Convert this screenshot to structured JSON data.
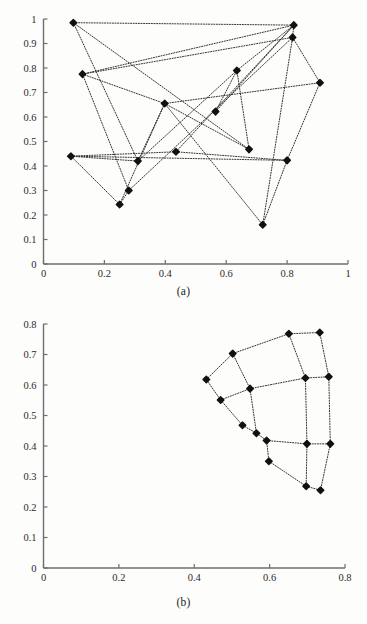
{
  "figure": {
    "subcaption_a": "(a)",
    "subcaption_b": "(b)",
    "bottom_artifact": ""
  },
  "chart_data": [
    {
      "id": "a",
      "type": "scatter",
      "title": "",
      "subcaption": "(a)",
      "xlabel": "",
      "ylabel": "",
      "xlim": [
        0,
        1
      ],
      "ylim": [
        0,
        1
      ],
      "grid": false,
      "legend": null,
      "xticks": [
        0,
        0.2,
        0.4,
        0.6,
        0.8,
        1
      ],
      "xticklabels": [
        "0",
        "0.2",
        "0.4",
        "0.6",
        "0.8",
        "1"
      ],
      "yticks": [
        0,
        0.1,
        0.2,
        0.3,
        0.4,
        0.5,
        0.6,
        0.7,
        0.8,
        0.9,
        1
      ],
      "yticklabels": [
        "0",
        "0.1",
        "0.2",
        "0.3",
        "0.4",
        "0.5",
        "0.6",
        "0.7",
        "0.8",
        "0.9",
        "1"
      ],
      "marker": "filled-diamond",
      "line_style": "dotted",
      "points": [
        {
          "i": 0,
          "x": 0.098,
          "y": 0.985
        },
        {
          "i": 1,
          "x": 0.128,
          "y": 0.775
        },
        {
          "i": 2,
          "x": 0.09,
          "y": 0.44
        },
        {
          "i": 3,
          "x": 0.25,
          "y": 0.243
        },
        {
          "i": 4,
          "x": 0.28,
          "y": 0.3
        },
        {
          "i": 5,
          "x": 0.31,
          "y": 0.42
        },
        {
          "i": 6,
          "x": 0.398,
          "y": 0.655
        },
        {
          "i": 7,
          "x": 0.435,
          "y": 0.458
        },
        {
          "i": 8,
          "x": 0.565,
          "y": 0.622
        },
        {
          "i": 9,
          "x": 0.635,
          "y": 0.79
        },
        {
          "i": 10,
          "x": 0.675,
          "y": 0.468
        },
        {
          "i": 11,
          "x": 0.72,
          "y": 0.16
        },
        {
          "i": 12,
          "x": 0.8,
          "y": 0.423
        },
        {
          "i": 13,
          "x": 0.818,
          "y": 0.925
        },
        {
          "i": 14,
          "x": 0.822,
          "y": 0.975
        },
        {
          "i": 15,
          "x": 0.908,
          "y": 0.74
        }
      ],
      "edges": [
        [
          0,
          14
        ],
        [
          0,
          5
        ],
        [
          0,
          10
        ],
        [
          1,
          14
        ],
        [
          1,
          13
        ],
        [
          1,
          6
        ],
        [
          1,
          4
        ],
        [
          2,
          5
        ],
        [
          2,
          12
        ],
        [
          2,
          3
        ],
        [
          2,
          7
        ],
        [
          3,
          6
        ],
        [
          3,
          4
        ],
        [
          4,
          13
        ],
        [
          5,
          9
        ],
        [
          5,
          6
        ],
        [
          6,
          10
        ],
        [
          6,
          11
        ],
        [
          6,
          15
        ],
        [
          7,
          12
        ],
        [
          7,
          14
        ],
        [
          8,
          14
        ],
        [
          8,
          9
        ],
        [
          9,
          10
        ],
        [
          9,
          14
        ],
        [
          11,
          13
        ],
        [
          11,
          12
        ],
        [
          12,
          15
        ],
        [
          13,
          14
        ],
        [
          13,
          15
        ]
      ]
    },
    {
      "id": "b",
      "type": "scatter",
      "title": "",
      "subcaption": "(b)",
      "xlabel": "",
      "ylabel": "",
      "xlim": [
        0,
        0.8
      ],
      "ylim": [
        0,
        0.8
      ],
      "grid": false,
      "legend": null,
      "xticks": [
        0,
        0.2,
        0.4,
        0.6,
        0.8
      ],
      "xticklabels": [
        "0",
        "0.2",
        "0.4",
        "0.6",
        "0.8"
      ],
      "yticks": [
        0,
        0.1,
        0.2,
        0.3,
        0.4,
        0.5,
        0.6,
        0.7,
        0.8
      ],
      "yticklabels": [
        "0",
        "0.1",
        "0.2",
        "0.3",
        "0.4",
        "0.5",
        "0.6",
        "0.7",
        "0.8"
      ],
      "marker": "filled-diamond",
      "line_style": "dotted",
      "points": [
        {
          "i": 0,
          "x": 0.432,
          "y": 0.618
        },
        {
          "i": 1,
          "x": 0.502,
          "y": 0.703
        },
        {
          "i": 2,
          "x": 0.651,
          "y": 0.768
        },
        {
          "i": 3,
          "x": 0.733,
          "y": 0.772
        },
        {
          "i": 4,
          "x": 0.47,
          "y": 0.551
        },
        {
          "i": 5,
          "x": 0.548,
          "y": 0.588
        },
        {
          "i": 6,
          "x": 0.695,
          "y": 0.623
        },
        {
          "i": 7,
          "x": 0.757,
          "y": 0.627
        },
        {
          "i": 8,
          "x": 0.528,
          "y": 0.468
        },
        {
          "i": 9,
          "x": 0.565,
          "y": 0.442
        },
        {
          "i": 10,
          "x": 0.592,
          "y": 0.418
        },
        {
          "i": 11,
          "x": 0.699,
          "y": 0.407
        },
        {
          "i": 12,
          "x": 0.761,
          "y": 0.407
        },
        {
          "i": 13,
          "x": 0.598,
          "y": 0.35
        },
        {
          "i": 14,
          "x": 0.697,
          "y": 0.268
        },
        {
          "i": 15,
          "x": 0.735,
          "y": 0.255
        }
      ],
      "edges": [
        [
          0,
          1
        ],
        [
          1,
          2
        ],
        [
          2,
          3
        ],
        [
          0,
          4
        ],
        [
          1,
          5
        ],
        [
          2,
          6
        ],
        [
          3,
          7
        ],
        [
          4,
          5
        ],
        [
          5,
          6
        ],
        [
          6,
          7
        ],
        [
          4,
          8
        ],
        [
          5,
          9
        ],
        [
          6,
          11
        ],
        [
          7,
          12
        ],
        [
          8,
          9
        ],
        [
          9,
          10
        ],
        [
          10,
          11
        ],
        [
          11,
          12
        ],
        [
          10,
          13
        ],
        [
          11,
          14
        ],
        [
          12,
          15
        ],
        [
          13,
          14
        ],
        [
          14,
          15
        ]
      ]
    }
  ]
}
